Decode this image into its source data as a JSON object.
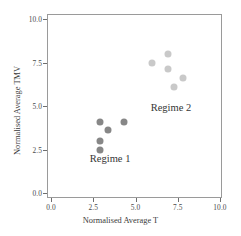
{
  "chart_data": {
    "type": "scatter",
    "title": "",
    "xlabel": "Normalised Average T",
    "ylabel": "Normalised Average TMV",
    "xlim": [
      0.0,
      10.0
    ],
    "ylim": [
      0.0,
      10.0
    ],
    "xticks": [
      "0.0",
      "2.5",
      "5.0",
      "7.5",
      "10.0"
    ],
    "xtick_values": [
      0.0,
      2.5,
      5.0,
      7.5,
      10.0
    ],
    "yticks": [
      "0.0",
      "2.5",
      "5.0",
      "7.5",
      "10.0"
    ],
    "ytick_values": [
      0.0,
      2.5,
      5.0,
      7.5,
      10.0
    ],
    "grid": false,
    "legend": "none",
    "series": [
      {
        "name": "Regime 1",
        "color": "#878787",
        "points": [
          {
            "x": 2.9,
            "y": 4.1
          },
          {
            "x": 4.3,
            "y": 4.1
          },
          {
            "x": 3.4,
            "y": 3.6
          },
          {
            "x": 2.9,
            "y": 3.0
          },
          {
            "x": 2.9,
            "y": 2.5
          }
        ]
      },
      {
        "name": "Regime 2",
        "color": "#c9c9c9",
        "points": [
          {
            "x": 6.0,
            "y": 7.5
          },
          {
            "x": 6.9,
            "y": 8.0
          },
          {
            "x": 6.9,
            "y": 7.1
          },
          {
            "x": 7.3,
            "y": 6.1
          },
          {
            "x": 7.8,
            "y": 6.6
          }
        ]
      }
    ],
    "annotations": [
      {
        "text": "Regime 1",
        "x": 2.3,
        "y": 1.9
      },
      {
        "text": "Regime 2",
        "x": 5.9,
        "y": 4.8
      }
    ]
  }
}
